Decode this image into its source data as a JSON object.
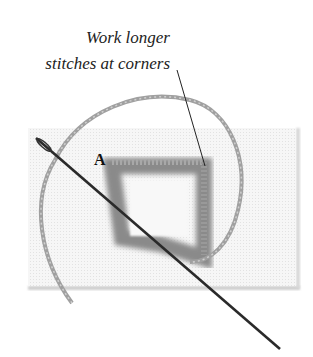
{
  "diagram": {
    "caption_line1": "Work longer",
    "caption_line2": "stitches at corners",
    "point_label": "A",
    "colors": {
      "fabric": "#f4f4f4",
      "fabric_shadow": "#cfcfcf",
      "thread": "#9a9a9a",
      "stitches": "#8a8a8a",
      "needle": "#2a2a2a",
      "leader_line": "#222222"
    },
    "elements": [
      "fabric-swatch",
      "square-stitched-frame",
      "thread-loop",
      "needle",
      "leader-line"
    ]
  }
}
